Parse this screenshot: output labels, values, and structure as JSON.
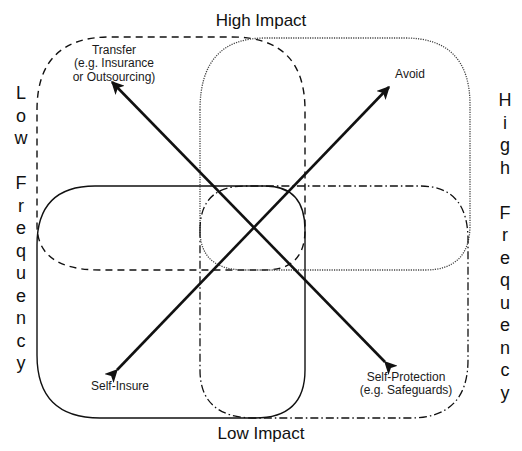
{
  "axes": {
    "top": "High Impact",
    "bottom": "Low Impact",
    "left": "L\no\nw\n\nF\nr\ne\nq\nu\ne\nn\nc\ny",
    "right": "H\ni\ng\nh\n\nF\nr\ne\nq\nu\ne\nn\nc\ny",
    "left_text": "Low Frequency",
    "right_text": "High Frequency"
  },
  "strategies": {
    "transfer": {
      "line1": "Transfer",
      "line2": "(e.g. Insurance",
      "line3": "or Outsourcing)",
      "border": "dashed",
      "quadrant": "High Impact / Low Frequency"
    },
    "avoid": {
      "line1": "Avoid",
      "border": "dotted",
      "quadrant": "High Impact / High Frequency"
    },
    "self_insure": {
      "line1": "Self-Insure",
      "border": "solid",
      "quadrant": "Low Impact / Low Frequency"
    },
    "self_protection": {
      "line1": "Self-Protection",
      "line2": "(e.g. Safeguards)",
      "border": "dash-dot",
      "quadrant": "Low Impact / High Frequency"
    }
  },
  "arrows": [
    {
      "from": "self_protection",
      "to": "transfer"
    },
    {
      "from": "self_insure",
      "to": "avoid"
    }
  ],
  "colors": {
    "line": "#111111",
    "background": "#ffffff"
  }
}
